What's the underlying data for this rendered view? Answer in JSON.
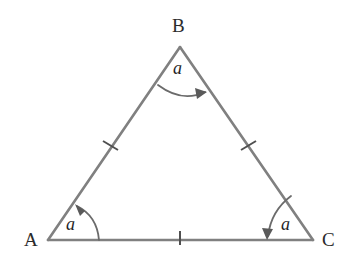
{
  "figure": {
    "kind": "geometry-diagram",
    "background_color": "#ffffff",
    "stroke_color": "#808080",
    "stroke_width": 2.6,
    "mark_color": "#5a5a5a",
    "arc_color": "#6b6b6b",
    "label_color": "#2b2b2b",
    "vertex_labels": [
      {
        "name": "B",
        "text": "B",
        "x": 180,
        "y": 47,
        "label_x": 172,
        "label_y": 16
      },
      {
        "name": "A",
        "text": "A",
        "x": 48,
        "y": 240,
        "label_x": 24,
        "label_y": 230
      },
      {
        "name": "C",
        "text": "C",
        "x": 313,
        "y": 240,
        "label_x": 322,
        "label_y": 230
      }
    ],
    "angle_labels": [
      {
        "at": "B",
        "text": "a",
        "x": 180,
        "y": 68
      },
      {
        "at": "A",
        "text": "a",
        "x": 73,
        "y": 224
      },
      {
        "at": "C",
        "text": "a",
        "x": 288,
        "y": 224
      }
    ],
    "side_marks": [
      {
        "side": "AB",
        "ticks": 1,
        "x": 110,
        "y": 145
      },
      {
        "side": "BC",
        "ticks": 1,
        "x": 248,
        "y": 145
      },
      {
        "side": "AC",
        "ticks": 1,
        "x": 180,
        "y": 237
      }
    ],
    "angle_arcs": [
      {
        "at": "B",
        "direction": "left-to-right",
        "arrow_end": "right"
      },
      {
        "at": "A",
        "direction": "base-to-side",
        "arrow_end": "up-left"
      },
      {
        "at": "C",
        "direction": "side-to-base",
        "arrow_end": "down-left"
      }
    ]
  }
}
